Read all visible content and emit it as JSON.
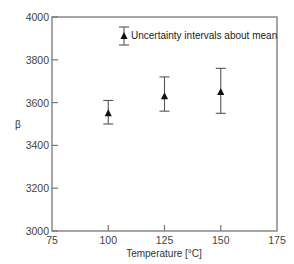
{
  "chart_data": {
    "type": "scatter",
    "title": "",
    "xlabel": "Temperature [°C]",
    "ylabel": "β",
    "xlim": [
      75,
      175
    ],
    "ylim": [
      3000,
      4000
    ],
    "x_ticks": [
      75,
      100,
      125,
      150,
      175
    ],
    "y_ticks": [
      3000,
      3200,
      3400,
      3600,
      3800,
      4000
    ],
    "grid": false,
    "legend": {
      "position": "upper-right-inside",
      "entries": [
        "Uncertainty intervals about mean"
      ]
    },
    "series": [
      {
        "name": "Uncertainty intervals about mean",
        "marker": "triangle",
        "error_bars": true,
        "points": [
          {
            "x": 100,
            "y": 3550,
            "lower": 3500,
            "upper": 3610
          },
          {
            "x": 125,
            "y": 3630,
            "lower": 3560,
            "upper": 3720
          },
          {
            "x": 150,
            "y": 3650,
            "lower": 3550,
            "upper": 3760
          }
        ]
      }
    ]
  },
  "colors": {
    "axis": "#777777",
    "marker": "#111111",
    "errorbar": "#555555"
  }
}
